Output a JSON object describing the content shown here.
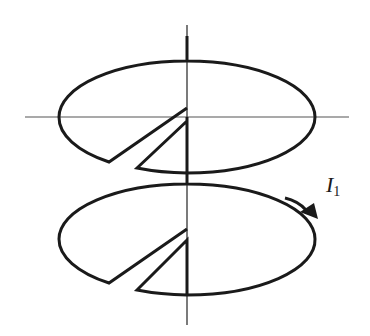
{
  "diagram": {
    "colors": {
      "stroke": "#1a1a1a",
      "thin_line": "#555555",
      "background": "#ffffff"
    },
    "current_label": {
      "symbol": "I",
      "subscript": "1"
    },
    "axis": {
      "vertical": {
        "x": 187,
        "y1": 25,
        "y2": 325
      },
      "horizontal": {
        "y": 117,
        "x1": 25,
        "x2": 349
      }
    },
    "loops": [
      {
        "name": "upper-loop",
        "cx": 187,
        "cy": 117,
        "rx": 128,
        "ry": 56
      },
      {
        "name": "lower-loop",
        "cx": 187,
        "cy": 239,
        "rx": 128,
        "ry": 55
      }
    ],
    "arrow": {
      "direction": "clockwise-viewed-from-top",
      "position": "right side of lower loop"
    }
  }
}
